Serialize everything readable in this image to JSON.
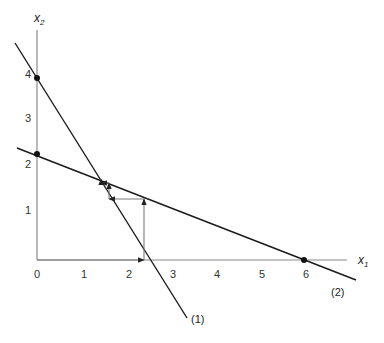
{
  "diagram": {
    "title": "",
    "axes": {
      "x_label": "x",
      "x_sub": "1",
      "y_label": "x",
      "y_sub": "2",
      "x_ticks": [
        "0",
        "1",
        "2",
        "3",
        "4",
        "5",
        "6"
      ],
      "y_ticks": [
        "1",
        "2",
        "3",
        "4"
      ]
    },
    "lines": [
      {
        "id": "1",
        "label": "(1)",
        "x_intercept": 2.35,
        "y_intercept": 3.9
      },
      {
        "id": "2",
        "label": "(2)",
        "x_intercept": 6.0,
        "y_intercept": 2.3
      }
    ],
    "points": [
      {
        "name": "line1-y-intercept",
        "x": 0,
        "y": 3.9
      },
      {
        "name": "line2-y-intercept",
        "x": 0,
        "y": 2.3
      },
      {
        "name": "line2-x-intercept",
        "x": 6,
        "y": 0
      }
    ],
    "iteration_path": [
      [
        2.35,
        0
      ],
      [
        2.35,
        1.33
      ],
      [
        1.58,
        1.33
      ],
      [
        1.58,
        1.64
      ],
      [
        1.4,
        1.64
      ]
    ],
    "colors": {
      "axis": "#8a8a8a",
      "line": "#1a1a1a",
      "iteration": "#7a7a7a",
      "background": "#ffffff"
    }
  }
}
